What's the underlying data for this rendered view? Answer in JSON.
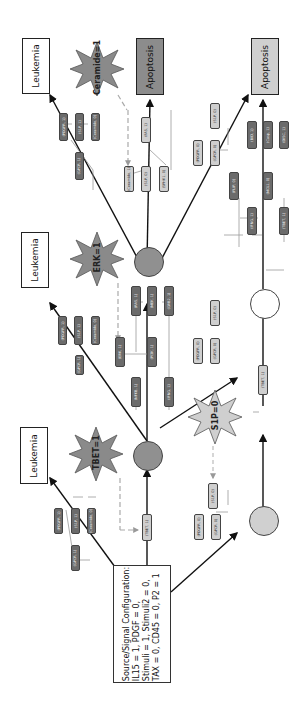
{
  "config": {
    "title": "Source/Signal Configuration:",
    "line1": "IL15 = 1, PDGF = 0,",
    "line2": "Stimuli = 1, Stimuli2 = 0,",
    "line3": "TAX = 0, CD45 = 0, P2 = 1"
  },
  "outcomes": {
    "leukemia_1": "Leukemia",
    "leukemia_2": "Leukemia",
    "leukemia_3": "Leukemia",
    "apoptosis_1": "Apoptosis",
    "apoptosis_2": "Apoptosis"
  },
  "stars": {
    "tbet": "TBET=1",
    "erk": "ERK=1",
    "ceramide": "Ceramide=1",
    "s1p": "S1P=0"
  },
  "nodes": {
    "n_tbet_l": "(TBET, 1)",
    "n_pdgfr_1": "(PDGFR, 1)",
    "n_s1p_1": "(S1P, 1)",
    "n_ceramide_1": "(Ceramide, 0)",
    "n_gpcr_1": "(GPCR, 1)",
    "n_pdgfr_2": "(PDGFR, 1)",
    "n_s1p_2": "(S1P, 1)",
    "n_ceramide_2": "(Ceramide, 0)",
    "n_gpcr_2": "(GPCR, 1)",
    "n_ras": "(RAS, 1)",
    "n_mek": "(MEK, 1)",
    "n_grb2": "(GRB2, 1)",
    "n_erk": "(ERK, 1)",
    "n_pi3k": "(PI3K, 1)",
    "n_nfkb": "(NFKB, 1)",
    "n_ceramide_3": "(Ceramide, 1)",
    "n_s1p_3": "(S1P, 0)",
    "n_fas": "(FAS, 1)",
    "n_sphk1": "(SPHK1, 0)",
    "n_pdgfr_3": "(PDGFR, 0)",
    "n_s1p_4": "(S1P, 0)",
    "n_gpcr_3": "(GPCR, 0)",
    "n_bid": "(BID, 1)",
    "n_casp": "(Casp, 1)",
    "n_disc": "(DISC, 1)",
    "n_flip": "(FLIP, 0)",
    "n_mcl1": "(MCL1, 0)",
    "n_ifng": "(IFNG, 1)",
    "n_tbet_2": "(TBET, 1)",
    "n_sphk1_b": "(SPHK1, 0)",
    "n_pdgfr_4": "(PDGFR, 0)",
    "n_s1p_5": "(S1P, 0)",
    "n_gpcr_4": "(GPCR, 0)"
  },
  "colors": {
    "dark_node": "#6b6b6b",
    "light_node": "#cfcfcf",
    "star_dark": "#8a8a8a",
    "star_light": "#cfcfcf",
    "apoptosis_dark": "#8c8c8c",
    "apoptosis_light": "#cfcfcf",
    "circle_dark": "#909090",
    "circle_light": "#d0d0d0"
  }
}
